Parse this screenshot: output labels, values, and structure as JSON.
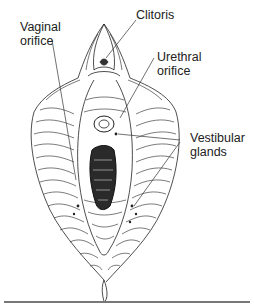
{
  "figure": {
    "labels": {
      "clitoris": "Clitoris",
      "vaginal_orifice": "Vaginal\norifice",
      "urethral_orifice": "Urethral\norifice",
      "vestibular_glands": "Vestibular\nglands"
    },
    "colors": {
      "ink": "#222222",
      "rule": "#777777",
      "background": "#ffffff"
    }
  }
}
